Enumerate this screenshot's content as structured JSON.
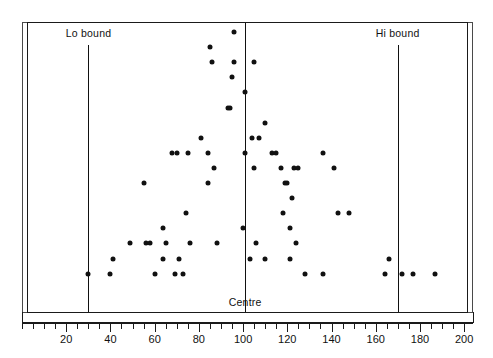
{
  "chart_data": {
    "type": "scatter",
    "title": "",
    "subtitle": "",
    "xlabel": "",
    "ylabel": "",
    "xlim": [
      0,
      200
    ],
    "ylim": [
      0,
      1
    ],
    "grid": false,
    "legend_position": "none",
    "x_major_ticks": [
      20,
      40,
      60,
      80,
      100,
      120,
      140,
      160,
      180,
      200
    ],
    "x_minor_tick_step": 5,
    "x_tick_labels": [
      "20",
      "40",
      "60",
      "80",
      "100",
      "120",
      "140",
      "160",
      "180",
      "200"
    ],
    "annotations": [
      {
        "name": "lo-bound",
        "label": "Lo bound",
        "x": 30,
        "label_align": "center"
      },
      {
        "name": "centre",
        "label": "Centre",
        "x": 101,
        "label_align": "center"
      },
      {
        "name": "hi-bound",
        "label": "Hi bound",
        "x": 170,
        "label_align": "center"
      }
    ],
    "point_style": {
      "color": "#111111",
      "size_px": 5,
      "shape": "circle"
    },
    "point_count": 89,
    "points": [
      {
        "x": 96,
        "row": 1
      },
      {
        "x": 85,
        "row": 2
      },
      {
        "x": 86,
        "row": 3
      },
      {
        "x": 96,
        "row": 3
      },
      {
        "x": 105,
        "row": 3
      },
      {
        "x": 95,
        "row": 4
      },
      {
        "x": 101,
        "row": 5
      },
      {
        "x": 93,
        "row": 6
      },
      {
        "x": 94,
        "row": 6
      },
      {
        "x": 110,
        "row": 7
      },
      {
        "x": 81,
        "row": 8
      },
      {
        "x": 104,
        "row": 8
      },
      {
        "x": 107,
        "row": 8
      },
      {
        "x": 68,
        "row": 9
      },
      {
        "x": 70,
        "row": 9
      },
      {
        "x": 75,
        "row": 9
      },
      {
        "x": 84,
        "row": 9
      },
      {
        "x": 101,
        "row": 9
      },
      {
        "x": 113,
        "row": 9
      },
      {
        "x": 115,
        "row": 9
      },
      {
        "x": 136,
        "row": 9
      },
      {
        "x": 87,
        "row": 10
      },
      {
        "x": 105,
        "row": 10
      },
      {
        "x": 117,
        "row": 10
      },
      {
        "x": 123,
        "row": 10
      },
      {
        "x": 125,
        "row": 10
      },
      {
        "x": 141,
        "row": 10
      },
      {
        "x": 55,
        "row": 11
      },
      {
        "x": 84,
        "row": 11
      },
      {
        "x": 119,
        "row": 11
      },
      {
        "x": 120,
        "row": 11
      },
      {
        "x": 122,
        "row": 12
      },
      {
        "x": 74,
        "row": 13
      },
      {
        "x": 118,
        "row": 13
      },
      {
        "x": 143,
        "row": 13
      },
      {
        "x": 148,
        "row": 13
      },
      {
        "x": 64,
        "row": 14
      },
      {
        "x": 100,
        "row": 14
      },
      {
        "x": 121,
        "row": 14
      },
      {
        "x": 49,
        "row": 15
      },
      {
        "x": 56,
        "row": 15
      },
      {
        "x": 58,
        "row": 15
      },
      {
        "x": 65,
        "row": 15
      },
      {
        "x": 76,
        "row": 15
      },
      {
        "x": 88,
        "row": 15
      },
      {
        "x": 106,
        "row": 15
      },
      {
        "x": 124,
        "row": 15
      },
      {
        "x": 41,
        "row": 16
      },
      {
        "x": 64,
        "row": 16
      },
      {
        "x": 71,
        "row": 16
      },
      {
        "x": 103,
        "row": 16
      },
      {
        "x": 110,
        "row": 16
      },
      {
        "x": 121,
        "row": 16
      },
      {
        "x": 166,
        "row": 16
      },
      {
        "x": 30,
        "row": 17
      },
      {
        "x": 40,
        "row": 17
      },
      {
        "x": 60,
        "row": 17
      },
      {
        "x": 69,
        "row": 17
      },
      {
        "x": 73,
        "row": 17
      },
      {
        "x": 128,
        "row": 17
      },
      {
        "x": 136,
        "row": 17
      },
      {
        "x": 164,
        "row": 17
      },
      {
        "x": 172,
        "row": 17
      },
      {
        "x": 177,
        "row": 17
      },
      {
        "x": 187,
        "row": 17
      }
    ]
  },
  "axis": {
    "left_cap": 0,
    "right_cap": 204
  }
}
